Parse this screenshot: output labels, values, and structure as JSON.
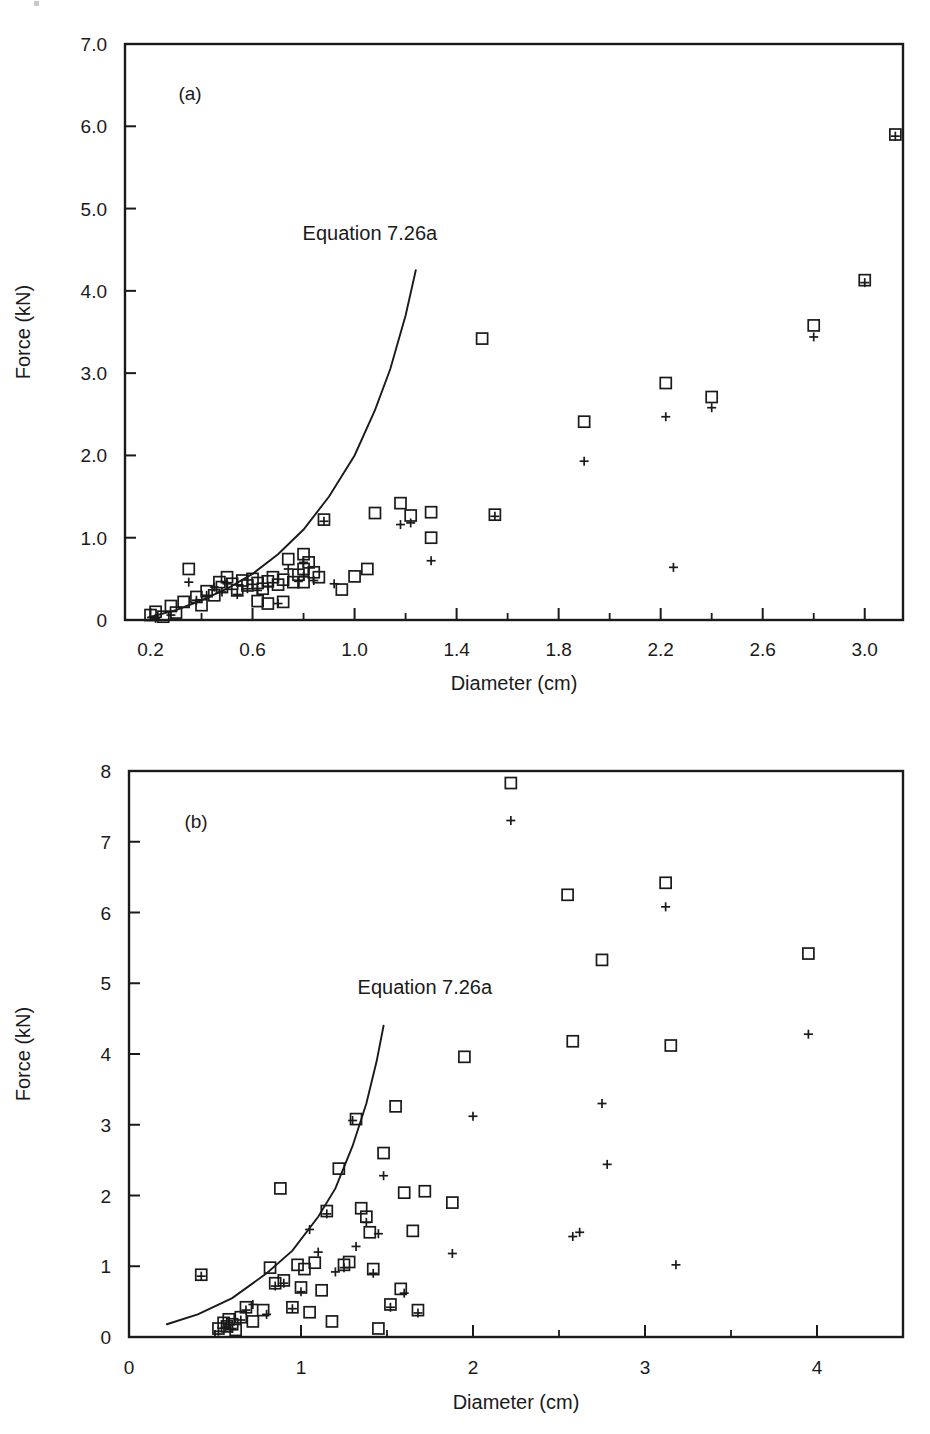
{
  "figure": {
    "marker_names": {
      "square": "square-marker",
      "plus": "plus-marker"
    },
    "ink_color": "#1a1a1a"
  },
  "chart_data": [
    {
      "id": "panel-a",
      "type": "scatter",
      "title": "",
      "panel_label": "(a)",
      "xlabel": "Diameter (cm)",
      "ylabel": "Force (kN)",
      "xlim": [
        0.1,
        3.15
      ],
      "ylim": [
        0,
        7.0
      ],
      "xticks": [
        0.2,
        0.6,
        1.0,
        1.4,
        1.8,
        2.2,
        2.6,
        3.0
      ],
      "xticklabels": [
        "0.2",
        "0.6",
        "1.0",
        "1.4",
        "1.8",
        "2.2",
        "2.6",
        "3.0"
      ],
      "xminorticks": [
        0.4,
        0.8,
        1.2,
        1.6,
        2.0,
        2.4,
        2.8
      ],
      "yticks": [
        0,
        1.0,
        2.0,
        3.0,
        4.0,
        5.0,
        6.0,
        7.0
      ],
      "yticklabels": [
        "0",
        "1.0",
        "2.0",
        "3.0",
        "4.0",
        "5.0",
        "6.0",
        "7.0"
      ],
      "grid": false,
      "legend": "none",
      "annotations": [
        {
          "text": "Equation 7.26a",
          "x": 1.06,
          "y": 4.62
        }
      ],
      "curve": {
        "name": "Equation 7.26a",
        "x": [
          0.19,
          0.3,
          0.4,
          0.5,
          0.6,
          0.7,
          0.8,
          0.9,
          1.0,
          1.08,
          1.14,
          1.2,
          1.24
        ],
        "y": [
          0.03,
          0.12,
          0.24,
          0.38,
          0.56,
          0.8,
          1.1,
          1.5,
          2.0,
          2.55,
          3.05,
          3.7,
          4.25
        ]
      },
      "series": [
        {
          "name": "square",
          "marker": "square",
          "points": [
            [
              0.2,
              0.06
            ],
            [
              0.22,
              0.1
            ],
            [
              0.25,
              0.04
            ],
            [
              0.28,
              0.17
            ],
            [
              0.3,
              0.09
            ],
            [
              0.33,
              0.22
            ],
            [
              0.35,
              0.62
            ],
            [
              0.38,
              0.28
            ],
            [
              0.4,
              0.18
            ],
            [
              0.42,
              0.35
            ],
            [
              0.45,
              0.3
            ],
            [
              0.47,
              0.46
            ],
            [
              0.48,
              0.4
            ],
            [
              0.5,
              0.52
            ],
            [
              0.52,
              0.44
            ],
            [
              0.54,
              0.36
            ],
            [
              0.56,
              0.48
            ],
            [
              0.58,
              0.42
            ],
            [
              0.6,
              0.5
            ],
            [
              0.62,
              0.45
            ],
            [
              0.64,
              0.38
            ],
            [
              0.66,
              0.47
            ],
            [
              0.68,
              0.52
            ],
            [
              0.7,
              0.43
            ],
            [
              0.72,
              0.49
            ],
            [
              0.74,
              0.74
            ],
            [
              0.76,
              0.46
            ],
            [
              0.78,
              0.55
            ],
            [
              0.8,
              0.8
            ],
            [
              0.8,
              0.62
            ],
            [
              0.8,
              0.46
            ],
            [
              0.82,
              0.7
            ],
            [
              0.84,
              0.58
            ],
            [
              0.86,
              0.52
            ],
            [
              0.62,
              0.23
            ],
            [
              0.66,
              0.2
            ],
            [
              0.72,
              0.22
            ],
            [
              0.88,
              1.22
            ],
            [
              0.95,
              0.37
            ],
            [
              1.0,
              0.53
            ],
            [
              1.05,
              0.62
            ],
            [
              1.08,
              1.3
            ],
            [
              1.18,
              1.42
            ],
            [
              1.22,
              1.27
            ],
            [
              1.3,
              1.31
            ],
            [
              1.3,
              1.0
            ],
            [
              1.5,
              3.42
            ],
            [
              1.55,
              1.28
            ],
            [
              1.9,
              2.41
            ],
            [
              2.22,
              2.88
            ],
            [
              2.4,
              2.71
            ],
            [
              2.8,
              3.58
            ],
            [
              3.0,
              4.13
            ],
            [
              3.12,
              5.9
            ]
          ]
        },
        {
          "name": "plus",
          "marker": "plus",
          "points": [
            [
              0.22,
              0.02
            ],
            [
              0.28,
              0.06
            ],
            [
              0.35,
              0.46
            ],
            [
              0.38,
              0.24
            ],
            [
              0.42,
              0.3
            ],
            [
              0.45,
              0.4
            ],
            [
              0.48,
              0.34
            ],
            [
              0.5,
              0.44
            ],
            [
              0.54,
              0.31
            ],
            [
              0.58,
              0.38
            ],
            [
              0.62,
              0.36
            ],
            [
              0.66,
              0.41
            ],
            [
              0.7,
              0.2
            ],
            [
              0.74,
              0.62
            ],
            [
              0.78,
              0.47
            ],
            [
              0.8,
              0.7
            ],
            [
              0.8,
              0.53
            ],
            [
              0.84,
              0.48
            ],
            [
              0.88,
              1.2
            ],
            [
              0.92,
              0.44
            ],
            [
              1.18,
              1.16
            ],
            [
              1.22,
              1.18
            ],
            [
              1.3,
              0.72
            ],
            [
              1.55,
              1.26
            ],
            [
              1.9,
              1.93
            ],
            [
              2.22,
              2.47
            ],
            [
              2.25,
              0.64
            ],
            [
              2.4,
              2.58
            ],
            [
              2.8,
              3.44
            ],
            [
              3.0,
              4.1
            ],
            [
              3.12,
              5.88
            ]
          ]
        }
      ]
    },
    {
      "id": "panel-b",
      "type": "scatter",
      "title": "",
      "panel_label": "(b)",
      "xlabel": "Diameter (cm)",
      "ylabel": "Force (kN)",
      "xlim": [
        0,
        4.5
      ],
      "ylim": [
        0,
        8
      ],
      "xticks": [
        0,
        1,
        2,
        3,
        4
      ],
      "xticklabels": [
        "0",
        "1",
        "2",
        "3",
        "4"
      ],
      "xminorticks": [
        0.5,
        1.5,
        2.5,
        3.5
      ],
      "yticks": [
        0,
        1,
        2,
        3,
        4,
        5,
        6,
        7,
        8
      ],
      "yticklabels": [
        "0",
        "1",
        "2",
        "3",
        "4",
        "5",
        "6",
        "7",
        "8"
      ],
      "grid": false,
      "legend": "none",
      "annotations": [
        {
          "text": "Equation 7.26a",
          "x": 1.72,
          "y": 4.85
        }
      ],
      "curve": {
        "name": "Equation 7.26a",
        "x": [
          0.22,
          0.4,
          0.6,
          0.8,
          0.95,
          1.1,
          1.2,
          1.3,
          1.38,
          1.44,
          1.48
        ],
        "y": [
          0.18,
          0.32,
          0.55,
          0.9,
          1.22,
          1.7,
          2.1,
          2.7,
          3.3,
          3.9,
          4.4
        ]
      },
      "series": [
        {
          "name": "square",
          "marker": "square",
          "points": [
            [
              0.42,
              0.88
            ],
            [
              0.52,
              0.12
            ],
            [
              0.55,
              0.2
            ],
            [
              0.57,
              0.15
            ],
            [
              0.58,
              0.25
            ],
            [
              0.6,
              0.18
            ],
            [
              0.62,
              0.1
            ],
            [
              0.65,
              0.28
            ],
            [
              0.68,
              0.42
            ],
            [
              0.72,
              0.22
            ],
            [
              0.78,
              0.38
            ],
            [
              0.82,
              0.98
            ],
            [
              0.85,
              0.76
            ],
            [
              0.88,
              2.1
            ],
            [
              0.9,
              0.8
            ],
            [
              0.95,
              0.42
            ],
            [
              0.98,
              1.02
            ],
            [
              1.0,
              0.7
            ],
            [
              1.02,
              0.96
            ],
            [
              1.05,
              0.35
            ],
            [
              1.08,
              1.05
            ],
            [
              1.12,
              0.66
            ],
            [
              1.15,
              1.78
            ],
            [
              1.18,
              0.22
            ],
            [
              1.22,
              2.38
            ],
            [
              1.25,
              1.02
            ],
            [
              1.28,
              1.06
            ],
            [
              1.32,
              3.08
            ],
            [
              1.35,
              1.82
            ],
            [
              1.38,
              1.7
            ],
            [
              1.4,
              1.48
            ],
            [
              1.42,
              0.96
            ],
            [
              1.45,
              0.12
            ],
            [
              1.48,
              2.6
            ],
            [
              1.52,
              0.46
            ],
            [
              1.55,
              3.26
            ],
            [
              1.58,
              0.68
            ],
            [
              1.6,
              2.04
            ],
            [
              1.65,
              1.5
            ],
            [
              1.68,
              0.38
            ],
            [
              1.72,
              2.06
            ],
            [
              1.88,
              1.9
            ],
            [
              1.95,
              3.96
            ],
            [
              2.22,
              7.83
            ],
            [
              2.55,
              6.25
            ],
            [
              2.58,
              4.18
            ],
            [
              2.75,
              5.33
            ],
            [
              3.12,
              6.42
            ],
            [
              3.15,
              4.12
            ],
            [
              3.95,
              5.42
            ]
          ]
        },
        {
          "name": "plus",
          "marker": "plus",
          "points": [
            [
              0.42,
              0.86
            ],
            [
              0.52,
              0.08
            ],
            [
              0.56,
              0.14
            ],
            [
              0.58,
              0.2
            ],
            [
              0.6,
              0.12
            ],
            [
              0.65,
              0.24
            ],
            [
              0.68,
              0.38
            ],
            [
              0.72,
              0.46
            ],
            [
              0.8,
              0.32
            ],
            [
              0.85,
              0.72
            ],
            [
              0.9,
              0.76
            ],
            [
              0.95,
              0.4
            ],
            [
              1.0,
              0.64
            ],
            [
              1.05,
              1.52
            ],
            [
              1.1,
              1.2
            ],
            [
              1.15,
              1.74
            ],
            [
              1.2,
              0.92
            ],
            [
              1.25,
              0.98
            ],
            [
              1.3,
              3.06
            ],
            [
              1.32,
              1.28
            ],
            [
              1.38,
              1.62
            ],
            [
              1.42,
              0.9
            ],
            [
              1.45,
              1.46
            ],
            [
              1.48,
              2.28
            ],
            [
              1.52,
              0.42
            ],
            [
              1.6,
              0.62
            ],
            [
              1.68,
              0.34
            ],
            [
              1.88,
              1.18
            ],
            [
              2.0,
              3.12
            ],
            [
              2.22,
              7.3
            ],
            [
              2.58,
              1.42
            ],
            [
              2.62,
              1.48
            ],
            [
              2.75,
              3.3
            ],
            [
              2.78,
              2.44
            ],
            [
              3.12,
              6.08
            ],
            [
              3.18,
              1.02
            ],
            [
              3.95,
              4.28
            ]
          ]
        }
      ]
    }
  ]
}
